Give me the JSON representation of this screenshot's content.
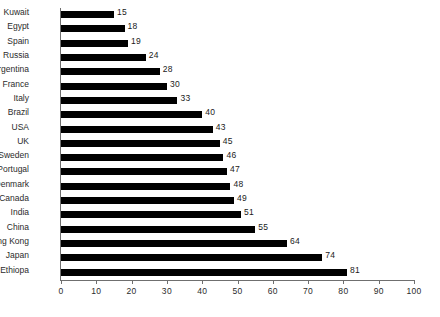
{
  "chart_data": {
    "type": "bar",
    "orientation": "horizontal",
    "title": "",
    "subtitle": "",
    "xlabel": "",
    "ylabel": "",
    "xlim": [
      0,
      100
    ],
    "xticks": [
      "0",
      "10",
      "20",
      "30",
      "40",
      "50",
      "60",
      "70",
      "80",
      "90",
      "100"
    ],
    "xtick_values": [
      0,
      10,
      20,
      30,
      40,
      50,
      60,
      70,
      80,
      90,
      100
    ],
    "grid": false,
    "legend": false,
    "show_value_labels": true,
    "bar_color": "#000000",
    "axis_color": "#6f6f6f",
    "text_color": "#2b2b2b",
    "categories": [
      "Kuwait",
      "Egypt",
      "Spain",
      "Russia",
      "Argentina",
      "France",
      "Italy",
      "Brazil",
      "USA",
      "UK",
      "Sweden",
      "Portugal",
      "Denmark",
      "Canada",
      "India",
      "China",
      "Hong Kong",
      "Japan",
      "Ethiopa"
    ],
    "values": [
      15,
      18,
      19,
      24,
      28,
      30,
      33,
      40,
      43,
      45,
      46,
      47,
      48,
      49,
      51,
      55,
      64,
      74,
      81
    ],
    "value_labels": [
      "15",
      "18",
      "19",
      "24",
      "28",
      "30",
      "33",
      "40",
      "43",
      "45",
      "46",
      "47",
      "48",
      "49",
      "51",
      "55",
      "64",
      "74",
      "81"
    ]
  }
}
